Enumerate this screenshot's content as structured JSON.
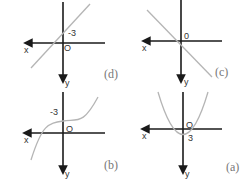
{
  "figure": {
    "orientation": "rotated 180 degrees",
    "panels": [
      {
        "id": "a",
        "caption": "(a)",
        "curve_type": "parabola opening downward",
        "y_intercept_label": "3",
        "origin_label": "O",
        "x_axis_label": "x",
        "y_axis_label": "y"
      },
      {
        "id": "b",
        "caption": "(b)",
        "curve_type": "cubic",
        "y_intercept_label": "-3",
        "origin_label": "O",
        "x_axis_label": "x",
        "y_axis_label": "y"
      },
      {
        "id": "c",
        "caption": "(c)",
        "curve_type": "line through origin, negative slope",
        "origin_label": "0",
        "x_axis_label": "x",
        "y_axis_label": "y"
      },
      {
        "id": "d",
        "caption": "(d)",
        "curve_type": "line, positive slope",
        "y_intercept_label": "-3",
        "origin_label": "O",
        "x_axis_label": "x",
        "y_axis_label": "y"
      }
    ]
  }
}
